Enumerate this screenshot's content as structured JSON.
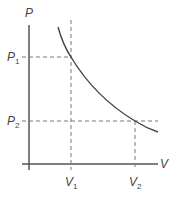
{
  "diagram": {
    "type": "pv-diagram",
    "y_axis_label": "P",
    "x_axis_label": "V",
    "y_ticks": [
      {
        "main": "P",
        "sub": "1"
      },
      {
        "main": "P",
        "sub": "2"
      }
    ],
    "x_ticks": [
      {
        "main": "V",
        "sub": "1"
      },
      {
        "main": "V",
        "sub": "2"
      }
    ],
    "points": [
      {
        "name": "state-1",
        "V": "V1",
        "P": "P1"
      },
      {
        "name": "state-2",
        "V": "V2",
        "P": "P2"
      }
    ],
    "curve": "decreasing hyperbola P vs V (isotherm)",
    "colors": {
      "axis": "#555555",
      "curve": "#444444",
      "dashed": "#777777",
      "text": "#444444"
    }
  }
}
